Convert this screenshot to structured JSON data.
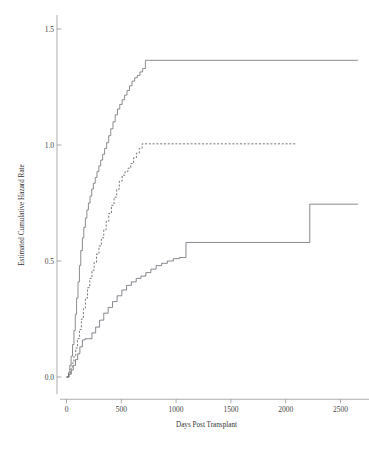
{
  "chart_data": {
    "type": "line",
    "title": "",
    "xlabel": "Days Post Transplant",
    "ylabel": "Estimated Cumulative Hazard Rate",
    "xlim": [
      -60,
      2760
    ],
    "ylim": [
      -0.04,
      1.56
    ],
    "xticks": [
      0,
      500,
      1000,
      1500,
      2000,
      2500
    ],
    "xticklabels": [
      "0",
      "500",
      "1000",
      "1500",
      "2000",
      "2500"
    ],
    "yticks": [
      0.0,
      0.5,
      1.0,
      1.5
    ],
    "yticklabels": [
      "0.0",
      "0.5",
      "1.0",
      "1.5"
    ],
    "grid": false,
    "legend": "none",
    "step_type": "post",
    "series": [
      {
        "name": "upper-curve",
        "style": "solid",
        "color": "#6f6f6f",
        "width": 0.8,
        "x": [
          0,
          18,
          30,
          42,
          55,
          68,
          80,
          92,
          105,
          118,
          130,
          145,
          158,
          172,
          186,
          200,
          215,
          230,
          245,
          262,
          278,
          295,
          312,
          330,
          348,
          366,
          385,
          404,
          424,
          444,
          465,
          486,
          508,
          530,
          552,
          575,
          598,
          622,
          646,
          670,
          695,
          720,
          2660
        ],
        "y": [
          0.0,
          0.02,
          0.05,
          0.09,
          0.14,
          0.2,
          0.27,
          0.34,
          0.41,
          0.48,
          0.545,
          0.6,
          0.645,
          0.685,
          0.72,
          0.75,
          0.78,
          0.81,
          0.835,
          0.86,
          0.885,
          0.91,
          0.935,
          0.96,
          0.985,
          1.01,
          1.04,
          1.07,
          1.1,
          1.13,
          1.155,
          1.175,
          1.195,
          1.215,
          1.235,
          1.255,
          1.275,
          1.29,
          1.3,
          1.315,
          1.33,
          1.365,
          1.365
        ]
      },
      {
        "name": "middle-curve",
        "style": "dashed",
        "color": "#555555",
        "width": 0.8,
        "x": [
          0,
          22,
          38,
          52,
          68,
          84,
          100,
          118,
          136,
          154,
          172,
          192,
          212,
          232,
          252,
          274,
          296,
          318,
          340,
          362,
          386,
          410,
          434,
          458,
          482,
          508,
          534,
          560,
          586,
          612,
          638,
          664,
          690,
          2100
        ],
        "y": [
          0.0,
          0.015,
          0.035,
          0.06,
          0.09,
          0.125,
          0.165,
          0.205,
          0.25,
          0.295,
          0.34,
          0.385,
          0.425,
          0.46,
          0.495,
          0.53,
          0.565,
          0.6,
          0.635,
          0.67,
          0.705,
          0.74,
          0.775,
          0.81,
          0.845,
          0.87,
          0.885,
          0.9,
          0.92,
          0.945,
          0.965,
          0.985,
          1.005,
          1.005
        ]
      },
      {
        "name": "lower-curve",
        "style": "solid",
        "color": "#6a6a72",
        "width": 0.8,
        "x": [
          0,
          24,
          44,
          62,
          82,
          102,
          122,
          145,
          170,
          200,
          232,
          266,
          302,
          340,
          380,
          420,
          462,
          505,
          548,
          592,
          636,
          680,
          724,
          770,
          818,
          868,
          920,
          975,
          1030,
          1090,
          2220,
          2660
        ],
        "y": [
          0.0,
          0.012,
          0.03,
          0.05,
          0.075,
          0.1,
          0.13,
          0.16,
          0.165,
          0.165,
          0.19,
          0.215,
          0.245,
          0.275,
          0.3,
          0.325,
          0.35,
          0.375,
          0.395,
          0.41,
          0.425,
          0.435,
          0.45,
          0.465,
          0.48,
          0.49,
          0.5,
          0.51,
          0.515,
          0.58,
          0.745,
          0.745
        ]
      }
    ]
  },
  "axes": {
    "x_title": "Days Post Transplant",
    "y_title": "Estimated Cumulative Hazard Rate"
  }
}
